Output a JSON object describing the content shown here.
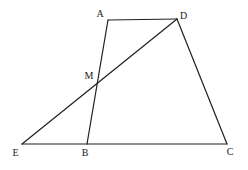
{
  "canvas": {
    "width": 248,
    "height": 170,
    "background": "#ffffff"
  },
  "figure": {
    "stroke_color": "#1f1f1f",
    "stroke_width": 1.2,
    "label_color": "#1a1a1a",
    "label_font_size": 10,
    "points": {
      "A": {
        "label": "A",
        "x": 108,
        "y": 20,
        "label_x": 100,
        "label_y": 16.5
      },
      "D": {
        "label": "D",
        "x": 177,
        "y": 19,
        "label_x": 183.5,
        "label_y": 19
      },
      "M": {
        "label": "M",
        "x": 99,
        "y": 81.5,
        "label_x": 89,
        "label_y": 79
      },
      "E": {
        "label": "E",
        "x": 22,
        "y": 144,
        "label_x": 15.5,
        "label_y": 155.5
      },
      "B": {
        "label": "B",
        "x": 87,
        "y": 144,
        "label_x": 85,
        "label_y": 155.5
      },
      "C": {
        "label": "C",
        "x": 227,
        "y": 144,
        "label_x": 230,
        "label_y": 155
      }
    },
    "segments": [
      {
        "from": "A",
        "to": "D"
      },
      {
        "from": "A",
        "to": "B"
      },
      {
        "from": "D",
        "to": "C"
      },
      {
        "from": "E",
        "to": "C"
      },
      {
        "from": "E",
        "to": "D"
      }
    ]
  }
}
